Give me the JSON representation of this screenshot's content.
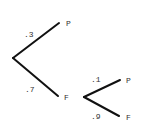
{
  "diagram": {
    "type": "probability-tree",
    "levels": [
      {
        "branches": [
          {
            "probability": ".3",
            "outcome": "P"
          },
          {
            "probability": ".7",
            "outcome": "F"
          }
        ]
      },
      {
        "parent_outcome": "F",
        "branches": [
          {
            "probability": ".1",
            "outcome": "P"
          },
          {
            "probability": ".9",
            "outcome": "F"
          }
        ]
      }
    ]
  }
}
